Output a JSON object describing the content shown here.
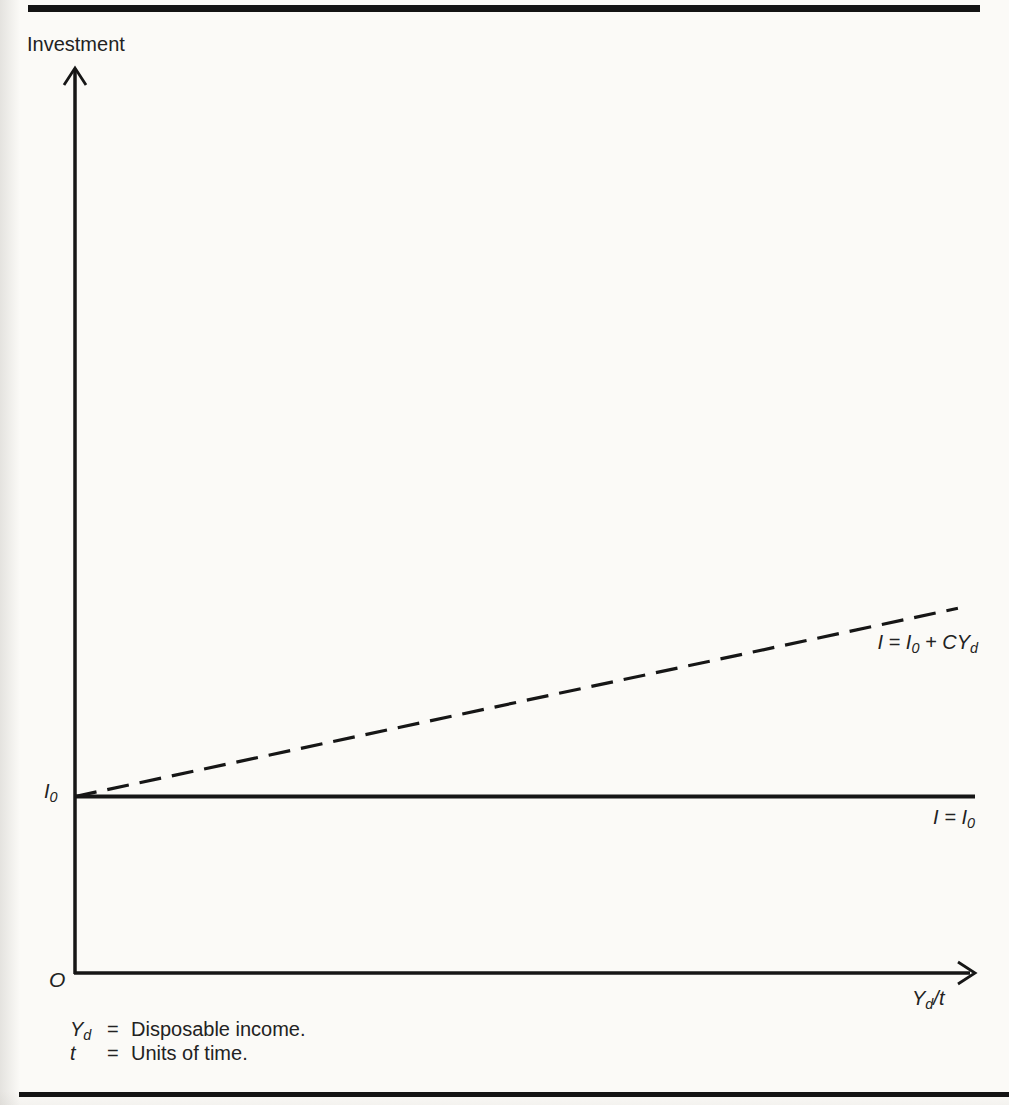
{
  "figure": {
    "background": "#fbfaf7",
    "line_color": "#161616",
    "text_color": "#222222"
  },
  "chart": {
    "y_axis_title": "Investment",
    "origin_label": "O",
    "x_axis_label_rich": [
      {
        "t": "Y"
      },
      {
        "t": "d",
        "sub": true
      },
      {
        "t": "/t"
      }
    ],
    "y_intercept_label_rich": [
      {
        "t": "I"
      },
      {
        "t": "0",
        "sub": true
      }
    ],
    "solid_line_label_rich": [
      {
        "t": "I = I"
      },
      {
        "t": "0",
        "sub": true
      }
    ],
    "dashed_line_label_rich": [
      {
        "t": "I = I"
      },
      {
        "t": "0",
        "sub": true
      },
      {
        "t": " + CY"
      },
      {
        "t": "d",
        "sub": true
      }
    ]
  },
  "legend": {
    "items": [
      {
        "term_rich": [
          {
            "t": "Y"
          },
          {
            "t": "d",
            "sub": true
          }
        ],
        "eq": "=",
        "definition": "Disposable income."
      },
      {
        "term_rich": [
          {
            "t": "t"
          }
        ],
        "eq": "=",
        "definition": "Units of time."
      }
    ]
  },
  "chart_data": {
    "type": "line",
    "title": "",
    "xlabel": "Yd/t",
    "ylabel": "Investment",
    "x_axis_numeric": false,
    "y_axis_numeric": false,
    "axis_annotations": {
      "origin": "O",
      "y_intercept": "I0"
    },
    "series": [
      {
        "name": "I = I0",
        "label": "I = I0",
        "style": "solid",
        "points": [
          [
            0,
            0.195
          ],
          [
            1.0,
            0.195
          ]
        ]
      },
      {
        "name": "I = I0 + CYd",
        "label": "I = I0 + CYd",
        "style": "dashed",
        "points": [
          [
            0,
            0.195
          ],
          [
            0.981,
            0.403
          ]
        ]
      }
    ]
  }
}
